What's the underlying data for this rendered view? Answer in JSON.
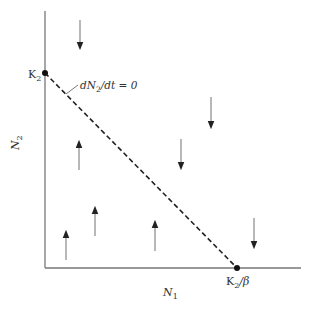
{
  "diagram": {
    "type": "phase-plane",
    "axes": {
      "x_label": "N",
      "x_label_sub": "1",
      "y_label": "N",
      "y_label_sub": "2",
      "color": "#777777"
    },
    "points": {
      "y_intercept": {
        "label": "K",
        "sub": "2"
      },
      "x_intercept": {
        "label": "K",
        "sub": "2",
        "suffix": "/β"
      }
    },
    "isocline": {
      "label_pre": "dN",
      "label_sub": "2",
      "label_post": "/dt = 0",
      "style": "dashed",
      "color": "#222222"
    },
    "arrows": [
      {
        "direction": "down",
        "region": "above"
      },
      {
        "direction": "down",
        "region": "above"
      },
      {
        "direction": "down",
        "region": "above"
      },
      {
        "direction": "down",
        "region": "above"
      },
      {
        "direction": "up",
        "region": "below"
      },
      {
        "direction": "up",
        "region": "below"
      },
      {
        "direction": "up",
        "region": "below"
      },
      {
        "direction": "up",
        "region": "below"
      }
    ]
  }
}
